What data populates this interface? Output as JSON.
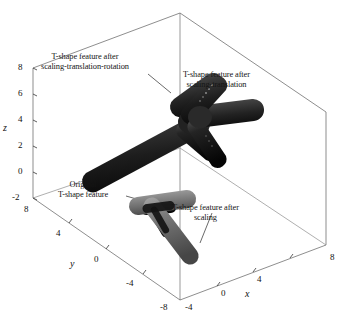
{
  "figure": {
    "type": "3d-scene",
    "background": "#ffffff",
    "line_color": "#5a5a5a"
  },
  "axes": {
    "z": {
      "name": "z",
      "ticks": [
        "8",
        "6",
        "4",
        "2",
        "0",
        "-2"
      ],
      "range": [
        -2,
        8
      ]
    },
    "y": {
      "name": "y",
      "ticks": [
        "8",
        "4",
        "0",
        "-4",
        "-8"
      ],
      "range": [
        -8,
        8
      ]
    },
    "x": {
      "name": "x",
      "ticks": [
        "-4",
        "0",
        "4",
        "8"
      ],
      "range": [
        -4,
        8
      ]
    }
  },
  "annotations": [
    {
      "id": "scaling-translation-rotation",
      "line1": "T-shape feature after",
      "line2": "scaling-translation-rotation"
    },
    {
      "id": "scaling-translation",
      "line1": "T-shape feature after",
      "line2": "scaling-translation"
    },
    {
      "id": "original",
      "line1": "Original",
      "line2": "T-shape feature"
    },
    {
      "id": "scaling",
      "line1": "T-shape feature after",
      "line2": "scaling"
    }
  ],
  "shapes": [
    {
      "id": "t-shape-rotated",
      "label": "T-shape feature after scaling-translation-rotation",
      "color": "#2b2b2b",
      "highlight": "#585858",
      "shadow": "#0d0d0d"
    },
    {
      "id": "t-shape-scaled-translated",
      "label": "T-shape feature after scaling-translation",
      "color": "#333333",
      "highlight": "#6a6a6a",
      "shadow": "#101010"
    },
    {
      "id": "t-shape-original",
      "label": "Original T-shape feature",
      "color": "#1f1f1f",
      "highlight": "#4a4a4a",
      "shadow": "#080808"
    },
    {
      "id": "t-shape-scaled",
      "label": "T-shape feature after scaling",
      "color": "#7b7b7b",
      "highlight": "#a9a9a9",
      "shadow": "#4e4e4e"
    }
  ]
}
